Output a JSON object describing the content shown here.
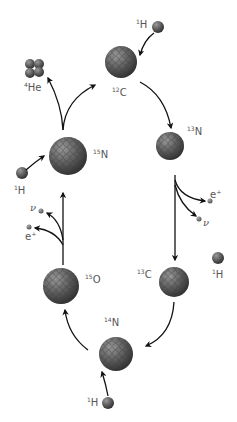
{
  "diagram": {
    "nuclei": [
      {
        "id": "c12",
        "mass": "12",
        "symbol": "C",
        "cx": 121,
        "cy": 62,
        "r": 16
      },
      {
        "id": "n13",
        "mass": "13",
        "symbol": "N",
        "cx": 170,
        "cy": 146,
        "r": 14
      },
      {
        "id": "c13",
        "mass": "13",
        "symbol": "C",
        "cx": 174,
        "cy": 282,
        "r": 15
      },
      {
        "id": "n14",
        "mass": "14",
        "symbol": "N",
        "cx": 116,
        "cy": 354,
        "r": 17
      },
      {
        "id": "o15",
        "mass": "15",
        "symbol": "O",
        "cx": 61,
        "cy": 286,
        "r": 18
      },
      {
        "id": "n15",
        "mass": "15",
        "symbol": "N",
        "cx": 68,
        "cy": 156,
        "r": 19
      },
      {
        "id": "he4",
        "mass": "4",
        "symbol": "He",
        "cx": 34,
        "cy": 68,
        "r": 9
      }
    ],
    "labels": {
      "c12": {
        "mass": "12",
        "symbol": "C"
      },
      "n13": {
        "mass": "13",
        "symbol": "N"
      },
      "c13": {
        "mass": "13",
        "symbol": "C"
      },
      "n14": {
        "mass": "14",
        "symbol": "N"
      },
      "o15": {
        "mass": "15",
        "symbol": "O"
      },
      "n15": {
        "mass": "15",
        "symbol": "N"
      },
      "he4": {
        "mass": "4",
        "symbol": "He"
      },
      "h_top": {
        "mass": "1",
        "symbol": "H"
      },
      "h_left": {
        "mass": "1",
        "symbol": "H"
      },
      "h_right": {
        "mass": "1",
        "symbol": "H"
      },
      "h_bottom": {
        "mass": "1",
        "symbol": "H"
      },
      "positron_right": "e⁺",
      "neutrino_right": "ν",
      "positron_left": "e⁺",
      "neutrino_left": "ν"
    },
    "colors": {
      "nucleus": "#555555",
      "proton": "#6a6a6a",
      "arrow": "#111111",
      "label": "#555555"
    }
  }
}
